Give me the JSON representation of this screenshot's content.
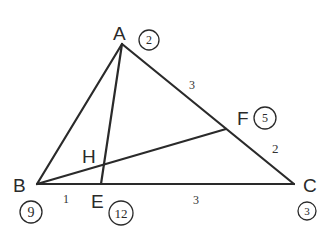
{
  "diagram": {
    "type": "triangle-with-cevians",
    "points": {
      "A": {
        "label": "A",
        "x": 122,
        "y": 44,
        "circled_value": "2"
      },
      "B": {
        "label": "B",
        "x": 37,
        "y": 184,
        "circled_value": "9"
      },
      "C": {
        "label": "C",
        "x": 294,
        "y": 184,
        "circled_value": "3"
      },
      "E": {
        "label": "E",
        "x": 101,
        "y": 184,
        "circled_value": "12"
      },
      "F": {
        "label": "F",
        "x": 226,
        "y": 129,
        "circled_value": "5"
      },
      "H": {
        "label": "H",
        "x": 103,
        "y": 165
      }
    },
    "segments": [
      {
        "from": "A",
        "to": "B"
      },
      {
        "from": "A",
        "to": "C"
      },
      {
        "from": "B",
        "to": "C"
      },
      {
        "from": "A",
        "to": "E"
      },
      {
        "from": "B",
        "to": "F"
      }
    ],
    "segment_ratios": {
      "AF": "3",
      "FC": "2",
      "BE": "1",
      "EC": "3"
    }
  }
}
